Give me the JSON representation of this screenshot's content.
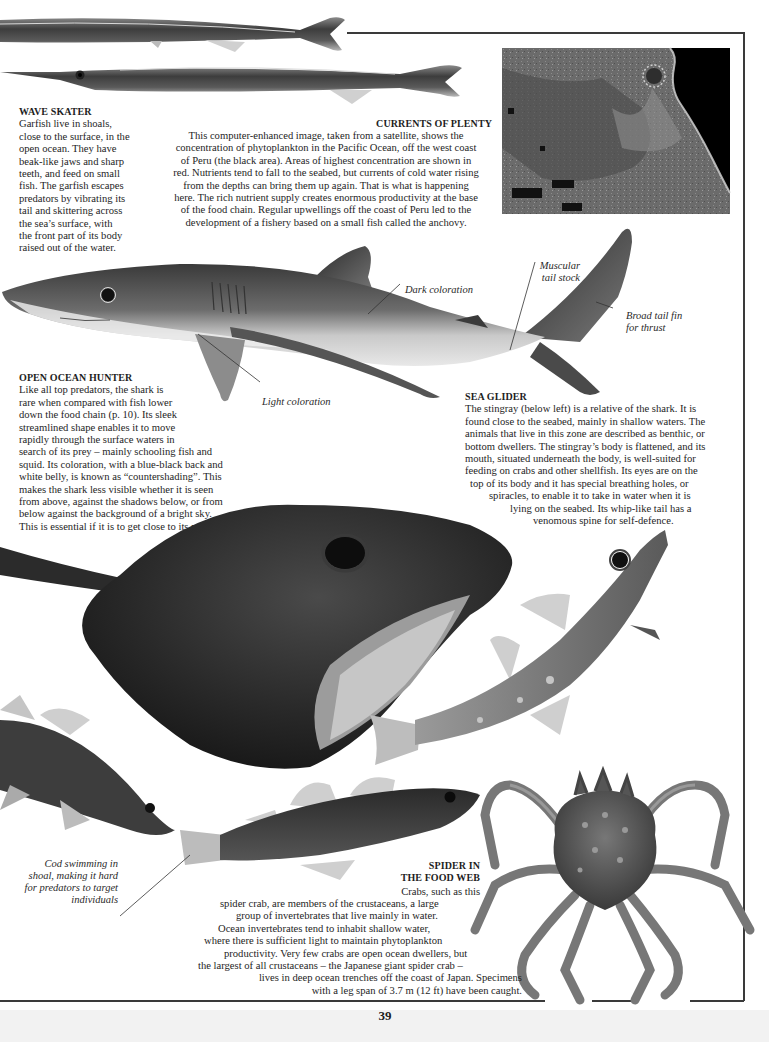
{
  "page": {
    "page_number": "39",
    "colors": {
      "text": "#1e1e1e",
      "rule": "#3a3a3a",
      "background": "#ffffff",
      "satellite_land": "#6e6e6e",
      "satellite_ocean": "#000000"
    }
  },
  "wave_skater": {
    "heading": "WAVE SKATER",
    "lines": [
      "Garfish live in shoals,",
      "close to the surface, in the",
      "open ocean. They have",
      "beak-like jaws and sharp",
      "teeth, and feed on small",
      "fish. The garfish escapes",
      "predators by vibrating its",
      "tail and skittering across",
      "the sea’s surface, with",
      "the front part of its body",
      "raised out of the water."
    ]
  },
  "currents_of_plenty": {
    "heading": "CURRENTS OF PLENTY",
    "lines": [
      "This computer-enhanced image, taken from a satellite, shows the",
      "concentration of phytoplankton in the Pacific Ocean, off the west coast",
      "of Peru (the black area). Areas of highest concentration are shown in",
      "red. Nutrients tend to fall to the seabed, but currents of cold water rising",
      "from the depths can bring them up again. That is what is happening",
      "here. The rich nutrient supply creates enormous productivity at the base",
      "of the food chain. Regular upwellings off the coast of Peru led to the",
      "development of a fishery based on a small fish called the anchovy."
    ]
  },
  "shark_labels": {
    "dark_coloration": "Dark coloration",
    "light_coloration": "Light coloration",
    "muscular_tail_stock": [
      "Muscular",
      "tail stock"
    ],
    "broad_tail_fin": [
      "Broad tail fin",
      "for thrust"
    ]
  },
  "open_ocean_hunter": {
    "heading": "OPEN OCEAN HUNTER",
    "lines": [
      "Like all top predators, the shark is",
      "rare when compared with fish lower",
      "down the food chain (p. 10). Its sleek",
      "streamlined shape enables it to move",
      "rapidly through the surface waters in",
      "search of its prey – mainly schooling fish and",
      "squid. Its coloration, with a blue-black back and",
      "white belly, is known as “countershading”. This",
      "makes the shark less visible whether it is seen",
      "from above, against the shadows below, or from",
      "below against the background of a bright sky.",
      "This is essential if it is to get close to its prey."
    ]
  },
  "sea_glider": {
    "heading": "SEA GLIDER",
    "lines": [
      "The stingray (below left) is a relative of the shark. It is",
      "found close to the seabed, mainly in shallow waters. The",
      "animals that live in this zone are described as benthic, or",
      "bottom dwellers. The stingray’s body is flattened, and its",
      "mouth, situated underneath the body, is well-suited for",
      "feeding on crabs and other shellfish. Its eyes are on the",
      "top of its body and it has special breathing holes, or",
      "spiracles, to enable it to take in water when it is",
      "lying on the seabed. Its whip-like tail has a",
      "venomous spine for self-defence."
    ]
  },
  "cod_caption": {
    "lines": [
      "Cod swimming in",
      "shoal, making it hard",
      "for predators to target",
      "individuals"
    ]
  },
  "spider_in_food_web": {
    "heading_lines": [
      "SPIDER IN",
      "THE FOOD WEB"
    ],
    "lines": [
      "Crabs, such as this",
      "spider crab, are members of the crustaceans, a large",
      "group of invertebrates that live mainly in water.",
      "Ocean invertebrates tend to inhabit shallow water,",
      "where there is sufficient light to maintain phytoplankton",
      "productivity. Very few crabs are open ocean dwellers, but",
      "the largest of all crustaceans – the Japanese giant spider crab –",
      "lives in deep ocean trenches off the coast of Japan. Specimens",
      "with a leg span of 3.7 m (12 ft) have been caught."
    ]
  },
  "images": {
    "garfish_top": "garfish-photo",
    "garfish_bottom": "garfish-photo",
    "satellite": "satellite-image-peru-coast",
    "shark": "blue-shark-photo",
    "stingray": "stingray-photo",
    "cod_upright": "cod-photo",
    "cod_left": "cod-photo",
    "cod_middle": "cod-photo",
    "spider_crab": "spider-crab-photo"
  }
}
